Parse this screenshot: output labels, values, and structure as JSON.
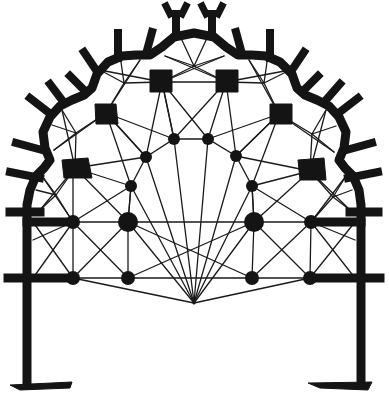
{
  "figure": {
    "type": "architectural-plan",
    "colors": {
      "ink": "#141414",
      "background": "#ffffff"
    }
  },
  "keystone": {
    "x": 194,
    "y": 303
  },
  "bosses_large": [
    {
      "x": 75,
      "y": 168
    },
    {
      "x": 106,
      "y": 113
    },
    {
      "x": 162,
      "y": 82
    },
    {
      "x": 226,
      "y": 82
    },
    {
      "x": 279,
      "y": 114
    },
    {
      "x": 310,
      "y": 171
    },
    {
      "x": 128,
      "y": 222
    },
    {
      "x": 254,
      "y": 222
    }
  ],
  "bosses_medium": [
    {
      "x": 174,
      "y": 139
    },
    {
      "x": 208,
      "y": 139
    },
    {
      "x": 146,
      "y": 157
    },
    {
      "x": 236,
      "y": 156
    },
    {
      "x": 131,
      "y": 186
    },
    {
      "x": 252,
      "y": 186
    },
    {
      "x": 73,
      "y": 222
    },
    {
      "x": 311,
      "y": 222
    },
    {
      "x": 73,
      "y": 278
    },
    {
      "x": 128,
      "y": 278
    },
    {
      "x": 252,
      "y": 278
    },
    {
      "x": 310,
      "y": 278
    }
  ],
  "chapels": [
    {
      "name": "chapel-left-low",
      "cx": 56,
      "cy": 192
    },
    {
      "name": "chapel-left-mid",
      "cx": 76,
      "cy": 131
    },
    {
      "name": "chapel-left-top",
      "cx": 128,
      "cy": 80
    },
    {
      "name": "chapel-axial",
      "cx": 194,
      "cy": 62
    },
    {
      "name": "chapel-right-top",
      "cx": 261,
      "cy": 80
    },
    {
      "name": "chapel-right-mid",
      "cx": 313,
      "cy": 132
    },
    {
      "name": "chapel-right-low",
      "cx": 333,
      "cy": 193
    }
  ]
}
